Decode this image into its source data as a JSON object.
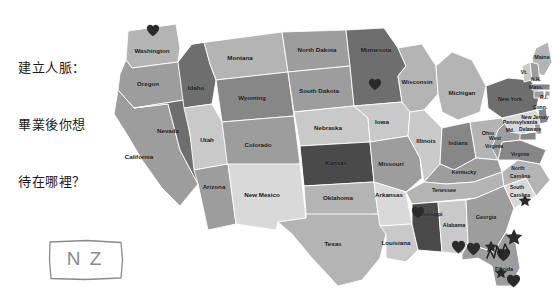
{
  "caption": {
    "lines": [
      "建立人脈：",
      "畢業後你想",
      "待在哪裡？"
    ]
  },
  "annotation_box": {
    "text": "N Z",
    "style": "hand-drawn-rectangle"
  },
  "map": {
    "title": "United States choropleth map",
    "palette": {
      "lightest": "#d9d9d9",
      "light": "#c9c9c9",
      "mid_light": "#b4b4b4",
      "mid": "#9d9d9d",
      "mid_dark": "#878787",
      "dark": "#6e6e6e",
      "darkest": "#4a4a4a",
      "outline": "#ffffff",
      "marker": "#2b2b2b",
      "label": "#14161a",
      "background": "#ffffff"
    },
    "states": [
      {
        "name": "Washington",
        "label": "Washington",
        "tone": "mid_light"
      },
      {
        "name": "Oregon",
        "label": "Oregon",
        "tone": "mid"
      },
      {
        "name": "Idaho",
        "label": "Idaho",
        "tone": "dark"
      },
      {
        "name": "Montana",
        "label": "Montana",
        "tone": "mid_light"
      },
      {
        "name": "Wyoming",
        "label": "Wyoming",
        "tone": "mid_dark"
      },
      {
        "name": "Nevada",
        "label": "Nevada",
        "tone": "dark"
      },
      {
        "name": "California",
        "label": "California",
        "tone": "mid"
      },
      {
        "name": "Utah",
        "label": "Utah",
        "tone": "light"
      },
      {
        "name": "Colorado",
        "label": "Colorado",
        "tone": "mid"
      },
      {
        "name": "Arizona",
        "label": "Arizona",
        "tone": "mid"
      },
      {
        "name": "New Mexico",
        "label": "New Mexico",
        "tone": "lightest"
      },
      {
        "name": "North Dakota",
        "label": "North Dakota",
        "tone": "mid"
      },
      {
        "name": "South Dakota",
        "label": "South Dakota",
        "tone": "mid"
      },
      {
        "name": "Nebraska",
        "label": "Nebraska",
        "tone": "light"
      },
      {
        "name": "Kansas",
        "label": "Kansas",
        "tone": "darkest"
      },
      {
        "name": "Oklahoma",
        "label": "Oklahoma",
        "tone": "mid_light"
      },
      {
        "name": "Texas",
        "label": "Texas",
        "tone": "mid_light"
      },
      {
        "name": "Minnesota",
        "label": "Minnesota",
        "tone": "dark"
      },
      {
        "name": "Iowa",
        "label": "Iowa",
        "tone": "light"
      },
      {
        "name": "Missouri",
        "label": "Missouri",
        "tone": "mid"
      },
      {
        "name": "Arkansas",
        "label": "Arkansas",
        "tone": "lightest"
      },
      {
        "name": "Louisiana",
        "label": "Louisiana",
        "tone": "light"
      },
      {
        "name": "Wisconsin",
        "label": "Wisconsin",
        "tone": "mid_light"
      },
      {
        "name": "Illinois",
        "label": "Illinois",
        "tone": "light"
      },
      {
        "name": "Michigan",
        "label": "Michigan",
        "tone": "mid_light"
      },
      {
        "name": "Indiana",
        "label": "Indiana",
        "tone": "mid_dark"
      },
      {
        "name": "Ohio",
        "label": "Ohio",
        "tone": "mid_light"
      },
      {
        "name": "Kentucky",
        "label": "Kentucky",
        "tone": "mid"
      },
      {
        "name": "Tennessee",
        "label": "Tenessee",
        "tone": "mid_light"
      },
      {
        "name": "Mississippi",
        "label": "Mississippi",
        "tone": "darkest"
      },
      {
        "name": "Alabama",
        "label": "Alabama",
        "tone": "light"
      },
      {
        "name": "Georgia",
        "label": "Georgia",
        "tone": "mid"
      },
      {
        "name": "Florida",
        "label": "Florida",
        "tone": "mid"
      },
      {
        "name": "South Carolina",
        "label": "South Carolina",
        "tone": "lightest"
      },
      {
        "name": "North Carolina",
        "label": "North Carolina",
        "tone": "mid_light"
      },
      {
        "name": "Virginia",
        "label": "Virginia",
        "tone": "mid_dark"
      },
      {
        "name": "West Virginia",
        "label": "West Virginia",
        "tone": "mid"
      },
      {
        "name": "Pennsylvania",
        "label": "Pennsylvania",
        "tone": "lightest"
      },
      {
        "name": "New York",
        "label": "New York",
        "tone": "dark"
      },
      {
        "name": "Maine",
        "label": "Maine",
        "tone": "mid_light"
      },
      {
        "name": "Vermont",
        "label": "Vt.",
        "tone": "light"
      },
      {
        "name": "New Hampshire",
        "label": "N.H.",
        "tone": "mid"
      },
      {
        "name": "Massachusetts",
        "label": "Mass.",
        "tone": "mid_dark"
      },
      {
        "name": "Rhode Island",
        "label": "R.I.",
        "tone": "mid"
      },
      {
        "name": "Connecticut",
        "label": "Conn.",
        "tone": "mid"
      },
      {
        "name": "New Jersey",
        "label": "New Jersey",
        "tone": "mid_dark"
      },
      {
        "name": "Delaware",
        "label": "Delaware",
        "tone": "mid"
      },
      {
        "name": "Maryland",
        "label": "Md.",
        "tone": "mid_dark"
      }
    ],
    "markers": [
      {
        "type": "heart",
        "state": "Washington"
      },
      {
        "type": "heart",
        "state": "Minnesota"
      },
      {
        "type": "heart",
        "state": "Mississippi"
      },
      {
        "type": "heart",
        "state": "Gulf Coast"
      },
      {
        "type": "heart",
        "state": "Gulf Coast"
      },
      {
        "type": "heart",
        "state": "Florida"
      },
      {
        "type": "heart",
        "state": "Florida"
      },
      {
        "type": "star",
        "state": "South Carolina"
      },
      {
        "type": "star",
        "state": "North Florida"
      },
      {
        "type": "star",
        "state": "Florida"
      },
      {
        "type": "scribble",
        "state": "Florida"
      },
      {
        "type": "star",
        "state": "offshore-right"
      }
    ],
    "marker_counts": {
      "hearts": 7,
      "stars": 4,
      "scribbles": 1
    }
  }
}
